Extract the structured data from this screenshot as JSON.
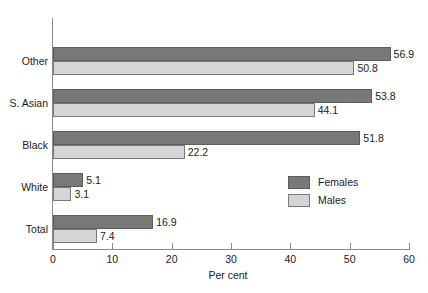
{
  "chart_data": {
    "type": "bar",
    "orientation": "horizontal",
    "title": "",
    "xlabel": "Per cent",
    "ylabel": "",
    "xlim": [
      0,
      60
    ],
    "xticks": [
      0,
      10,
      20,
      30,
      40,
      50,
      60
    ],
    "xtick_labels": [
      "0",
      "10",
      "20",
      "30",
      "40",
      "50",
      "60"
    ],
    "grid": false,
    "legend_position": "inside-right",
    "categories": [
      "Other",
      "S. Asian",
      "Black",
      "White",
      "Total"
    ],
    "series": [
      {
        "name": "Females",
        "color": "#787878",
        "values": [
          56.9,
          53.8,
          51.8,
          5.1,
          16.9
        ],
        "labels": [
          "56.9",
          "53.8",
          "51.8",
          "5.1",
          "16.9"
        ]
      },
      {
        "name": "Males",
        "color": "#d5d5d5",
        "values": [
          50.8,
          44.1,
          22.2,
          3.1,
          7.4
        ],
        "labels": [
          "50.8",
          "44.1",
          "22.2",
          "3.1",
          "7.4"
        ]
      }
    ]
  },
  "legend": {
    "items": [
      {
        "label": "Females",
        "swatch": "females"
      },
      {
        "label": "Males",
        "swatch": "males"
      }
    ]
  }
}
